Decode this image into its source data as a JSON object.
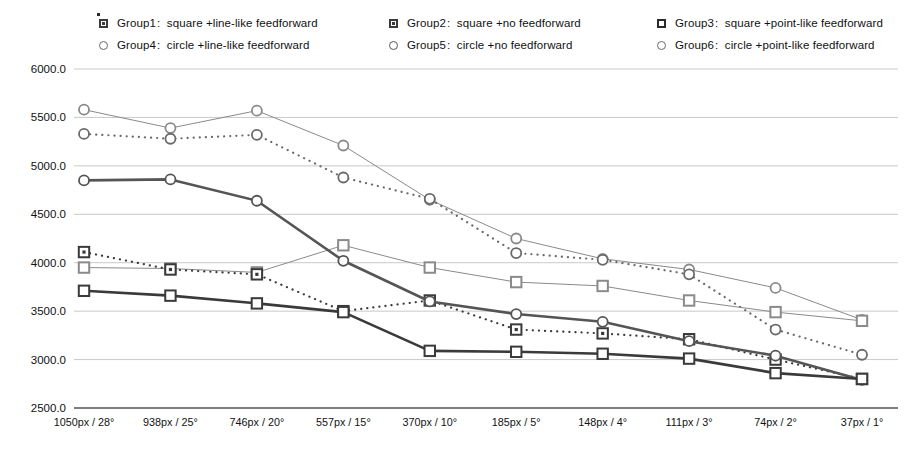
{
  "legend": {
    "rows": [
      [
        {
          "key": "Group1",
          "sep": ":",
          "desc": "square +line-like feedforward",
          "marker": "square-open-dot-icon"
        },
        {
          "key": "Group2",
          "sep": ":",
          "desc": "square +no feedforward",
          "marker": "square-open-dot-icon"
        },
        {
          "key": "Group3",
          "sep": ":",
          "desc": "square +point-like feedforward",
          "marker": "square-filled-icon"
        }
      ],
      [
        {
          "key": "Group4",
          "sep": ":",
          "desc": "circle +line-like feedforward",
          "marker": "circle-open-icon"
        },
        {
          "key": "Group5",
          "sep": ":",
          "desc": "circle +no feedforward",
          "marker": "circle-open-icon"
        },
        {
          "key": "Group6",
          "sep": ":",
          "desc": "circle +point-like feedforward",
          "marker": "circle-open-icon"
        }
      ]
    ]
  },
  "chart_data": {
    "type": "line",
    "title": "",
    "xlabel": "",
    "ylabel": "",
    "ylim": [
      2500,
      6000
    ],
    "ytick_step": 500,
    "grid": true,
    "legend_position": "top",
    "categories": [
      "1050px / 28°",
      "938px / 25°",
      "746px / 20°",
      "557px / 15°",
      "370px / 10°",
      "185px / 5°",
      "148px / 4°",
      "111px / 3°",
      "74px / 2°",
      "37px / 1°"
    ],
    "ytick_labels": [
      "6000.0",
      "5500.0",
      "5000.0",
      "4500.0",
      "4000.0",
      "3500.0",
      "3000.0",
      "2500.0"
    ],
    "ytick_values": [
      6000,
      5500,
      5000,
      4500,
      4000,
      3500,
      3000,
      2500
    ],
    "series": [
      {
        "name": "Group1",
        "label": "square +line-like feedforward",
        "marker": "square",
        "line": "solid-thin",
        "color": "#8a8a8a",
        "values": [
          3950,
          3940,
          3900,
          4180,
          3950,
          3800,
          3760,
          3610,
          3490,
          3400
        ]
      },
      {
        "name": "Group2",
        "label": "square +no feedforward",
        "marker": "square",
        "line": "solid-thick",
        "color": "#3a3a3a",
        "values": [
          3710,
          3660,
          3580,
          3490,
          3090,
          3080,
          3060,
          3010,
          2860,
          2800
        ]
      },
      {
        "name": "Group3",
        "label": "square +point-like feedforward",
        "marker": "square",
        "line": "dotted",
        "color": "#3a3a3a",
        "values": [
          4110,
          3930,
          3880,
          3500,
          3610,
          3310,
          3270,
          3210,
          3000,
          2800
        ]
      },
      {
        "name": "Group4",
        "label": "circle +line-like feedforward",
        "marker": "circle",
        "line": "solid-thin",
        "color": "#8a8a8a",
        "values": [
          5580,
          5390,
          5570,
          5210,
          4650,
          4250,
          4040,
          3930,
          3740,
          3410
        ]
      },
      {
        "name": "Group5",
        "label": "circle +no feedforward",
        "marker": "circle",
        "line": "solid-thick",
        "color": "#555555",
        "values": [
          4850,
          4860,
          4640,
          4020,
          3600,
          3470,
          3390,
          3190,
          3040,
          2790
        ]
      },
      {
        "name": "Group6",
        "label": "circle +point-like feedforward",
        "marker": "circle",
        "line": "dotted",
        "color": "#6a6a6a",
        "values": [
          5330,
          5280,
          5320,
          4880,
          4660,
          4100,
          4030,
          3880,
          3310,
          3050
        ]
      }
    ]
  }
}
